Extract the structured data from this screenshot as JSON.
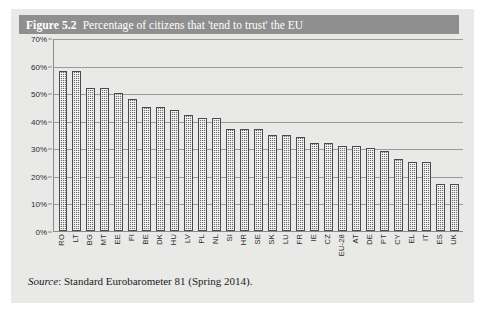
{
  "figure": {
    "number": "Figure 5.2",
    "caption": "Percentage of citizens that 'tend to trust' the EU",
    "source_label": "Source",
    "source_text": ": Standard Eurobarometer 81 (Spring 2014)."
  },
  "chart_data": {
    "type": "bar",
    "title": "Percentage of citizens that 'tend to trust' the EU",
    "xlabel": "",
    "ylabel": "",
    "ylim": [
      0,
      70
    ],
    "ytick_step": 10,
    "ytick_labels": [
      "70%",
      "60%",
      "50%",
      "40%",
      "30%",
      "20%",
      "10%",
      "0%"
    ],
    "ytick_values": [
      70,
      60,
      50,
      40,
      30,
      20,
      10,
      0
    ],
    "grid": true,
    "legend": false,
    "bar_color": "#6e6e6e",
    "bar_pattern": "checkerboard-dither",
    "categories": [
      "RO",
      "LT",
      "BG",
      "MT",
      "EE",
      "FI",
      "BE",
      "DK",
      "HU",
      "LV",
      "PL",
      "NL",
      "SI",
      "HR",
      "SE",
      "SK",
      "LU",
      "FR",
      "IE",
      "CZ",
      "EU-28",
      "AT",
      "DE",
      "PT",
      "CY",
      "EL",
      "IT",
      "ES",
      "UK"
    ],
    "values": [
      58,
      58,
      52,
      52,
      50,
      48,
      45,
      45,
      44,
      42,
      41,
      41,
      37,
      37,
      37,
      35,
      35,
      34,
      32,
      32,
      31,
      31,
      30,
      29,
      26,
      25,
      25,
      17,
      17
    ],
    "units": "percent"
  }
}
